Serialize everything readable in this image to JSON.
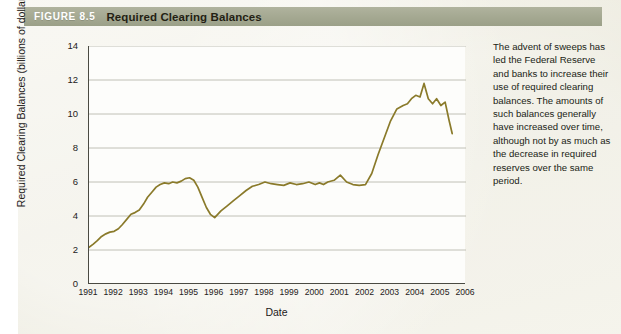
{
  "figure": {
    "number_label": "FIGURE 8.5",
    "title": "Required Clearing Balances",
    "header_bg": "#a4a891",
    "paper_bg": "#eceade"
  },
  "caption": {
    "text": "The advent of sweeps has led the Federal Reserve and banks to increase their use of required clearing balances. The amounts of such balances generally have increased over time, although not by as much as the decrease in required reserves over the same period."
  },
  "chart_data": {
    "type": "line",
    "title": "Required Clearing Balances",
    "xlabel": "Date",
    "ylabel": "Required Clearing Balances (billions of dollars)",
    "xlim": [
      1991,
      2006
    ],
    "ylim": [
      0,
      14
    ],
    "yticks": [
      0,
      2,
      4,
      6,
      8,
      10,
      12,
      14
    ],
    "xticks": [
      1991,
      1992,
      1993,
      1994,
      1995,
      1996,
      1997,
      1998,
      1999,
      2000,
      2001,
      2002,
      2003,
      2004,
      2005,
      2006
    ],
    "grid": "horizontal",
    "legend": "none",
    "line_color": "#8a7a2a",
    "series": [
      {
        "name": "Required Clearing Balances",
        "x": [
          1991.0,
          1991.17,
          1991.33,
          1991.5,
          1991.67,
          1991.83,
          1992.0,
          1992.17,
          1992.33,
          1992.5,
          1992.67,
          1992.83,
          1993.0,
          1993.17,
          1993.33,
          1993.5,
          1993.67,
          1993.83,
          1994.0,
          1994.17,
          1994.33,
          1994.5,
          1994.67,
          1994.83,
          1995.0,
          1995.17,
          1995.33,
          1995.5,
          1995.67,
          1995.83,
          1996.0,
          1996.25,
          1996.5,
          1996.75,
          1997.0,
          1997.25,
          1997.5,
          1997.75,
          1998.0,
          1998.25,
          1998.5,
          1998.75,
          1999.0,
          1999.25,
          1999.5,
          1999.75,
          2000.0,
          2000.17,
          2000.33,
          2000.5,
          2000.75,
          2001.0,
          2001.25,
          2001.5,
          2001.75,
          2002.0,
          2002.25,
          2002.5,
          2002.75,
          2003.0,
          2003.25,
          2003.5,
          2003.67,
          2003.83,
          2004.0,
          2004.17,
          2004.33,
          2004.5,
          2004.67,
          2004.83,
          2005.0,
          2005.17,
          2005.33,
          2005.45
        ],
        "values": [
          2.15,
          2.35,
          2.55,
          2.8,
          2.95,
          3.05,
          3.1,
          3.25,
          3.5,
          3.8,
          4.1,
          4.2,
          4.35,
          4.7,
          5.1,
          5.4,
          5.7,
          5.85,
          5.95,
          5.9,
          6.0,
          5.95,
          6.05,
          6.2,
          6.25,
          6.1,
          5.7,
          5.1,
          4.5,
          4.1,
          3.9,
          4.3,
          4.6,
          4.9,
          5.2,
          5.5,
          5.75,
          5.85,
          6.0,
          5.9,
          5.85,
          5.8,
          5.95,
          5.85,
          5.9,
          6.0,
          5.85,
          5.95,
          5.85,
          6.0,
          6.1,
          6.4,
          6.0,
          5.85,
          5.8,
          5.85,
          6.5,
          7.6,
          8.6,
          9.6,
          10.3,
          10.5,
          10.6,
          10.9,
          11.1,
          11.0,
          11.8,
          10.9,
          10.6,
          10.9,
          10.5,
          10.7,
          9.6,
          8.85
        ]
      }
    ]
  }
}
